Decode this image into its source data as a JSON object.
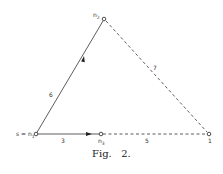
{
  "figure": {
    "caption": "Fig.   2.",
    "colors": {
      "line": "#333333",
      "background": "#ffffff"
    }
  },
  "nodes": [
    {
      "id": "n2",
      "label": "n2",
      "label_main": "n",
      "label_sub": "2",
      "x": 104,
      "y": 19
    },
    {
      "id": "n1",
      "label": "s = n1",
      "label_main": "s = n",
      "label_sub": "1",
      "x": 36,
      "y": 134
    },
    {
      "id": "n3",
      "label": "n3",
      "label_main": "n",
      "label_sub": "3",
      "x": 101,
      "y": 134
    },
    {
      "id": "t",
      "label": "1",
      "label_main": "1",
      "label_sub": "",
      "x": 209,
      "y": 134
    }
  ],
  "edges": [
    {
      "from": "n1",
      "to": "n2",
      "weight": "6",
      "style": "solid",
      "arrow": true
    },
    {
      "from": "n1",
      "to": "n3",
      "weight": "3",
      "style": "solid",
      "arrow": true
    },
    {
      "from": "n2",
      "to": "t",
      "weight": "7",
      "style": "dashed",
      "arrow": false
    },
    {
      "from": "n3",
      "to": "t",
      "weight": "5",
      "style": "dashed",
      "arrow": false
    }
  ]
}
